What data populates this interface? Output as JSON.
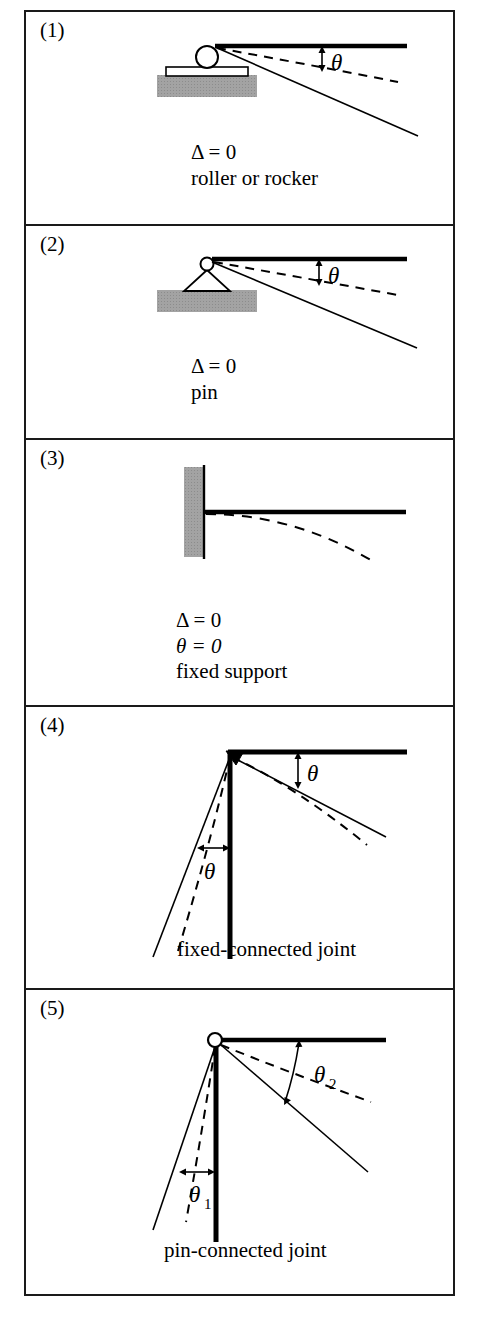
{
  "figure": {
    "border_color": "#1a1a1a",
    "hatch_color": "#a0a0a0",
    "line_color": "#000000"
  },
  "panels": [
    {
      "number": "(1)",
      "support_type": "roller or rocker",
      "icon": "roller-support-icon",
      "caption_lines": [
        "Δ = 0",
        "roller or rocker"
      ],
      "delta_label": "Δ = 0",
      "name_label": "roller or rocker",
      "angle_labels": [
        "θ"
      ],
      "conditions": [
        "Δ = 0"
      ],
      "has_deflection_curve": true
    },
    {
      "number": "(2)",
      "support_type": "pin",
      "icon": "pin-support-icon",
      "caption_lines": [
        "Δ = 0",
        "pin"
      ],
      "delta_label": "Δ = 0",
      "name_label": "pin",
      "angle_labels": [
        "θ"
      ],
      "conditions": [
        "Δ = 0"
      ],
      "has_deflection_curve": true
    },
    {
      "number": "(3)",
      "support_type": "fixed support",
      "icon": "fixed-support-icon",
      "caption_lines": [
        "Δ = 0",
        "θ = 0",
        "fixed support"
      ],
      "delta_label": "Δ = 0",
      "theta_label": "θ = 0",
      "name_label": "fixed support",
      "angle_labels": [],
      "conditions": [
        "Δ = 0",
        "θ = 0"
      ],
      "has_deflection_curve": true
    },
    {
      "number": "(4)",
      "support_type": "fixed-connected joint",
      "icon": "fixed-joint-icon",
      "caption_lines": [
        "fixed-connected joint"
      ],
      "name_label": "fixed-connected joint",
      "angle_labels": [
        "θ",
        "θ"
      ],
      "conditions": [],
      "has_deflection_curve": true
    },
    {
      "number": "(5)",
      "support_type": "pin-connected joint",
      "icon": "pin-joint-icon",
      "caption_lines": [
        "pin-connected joint"
      ],
      "name_label": "pin-connected joint",
      "angle_labels": [
        "θ",
        "θ"
      ],
      "angle_label_1_base": "θ",
      "angle_label_1_sub": "1",
      "angle_label_2_base": "θ",
      "angle_label_2_sub": "2",
      "conditions": [],
      "has_deflection_curve": true
    }
  ]
}
